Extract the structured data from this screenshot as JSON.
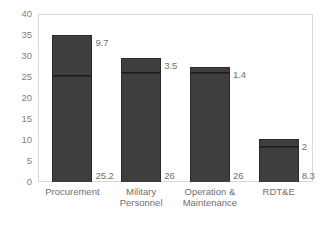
{
  "chart_data": {
    "type": "bar",
    "subtype": "stacked-bar",
    "title": "",
    "subtitle": "",
    "xlabel": "",
    "ylabel": "",
    "ylim": [
      0,
      40
    ],
    "yticks": [
      "0",
      "5",
      "10",
      "15",
      "20",
      "25",
      "30",
      "35",
      "40"
    ],
    "ytick_values": [
      0,
      5,
      10,
      15,
      20,
      25,
      30,
      35,
      40
    ],
    "grid": false,
    "legend": "none",
    "categories": [
      "Procurement",
      "Military\nPersonnel",
      "Operation &\nMaintenance",
      "RDT&E"
    ],
    "series": [
      {
        "name": "lower",
        "values": [
          25.2,
          26,
          26,
          8.3
        ],
        "labels": [
          "25.2",
          "26",
          "26",
          "8.3"
        ]
      },
      {
        "name": "upper",
        "values": [
          9.7,
          3.5,
          1.4,
          2
        ],
        "labels": [
          "9.7",
          "3.5",
          "1.4",
          "2"
        ]
      }
    ],
    "totals": [
      34.9,
      29.5,
      27.4,
      10.3
    ],
    "colors": {
      "bar_fill": "#3e3e3e",
      "bar_edge": "#2a2a2a",
      "divider": "#1c1c1c",
      "axis_text": "#808080",
      "label_text": "#6f6f6f",
      "frame": "#d9d9d9",
      "background": "#ffffff"
    }
  }
}
